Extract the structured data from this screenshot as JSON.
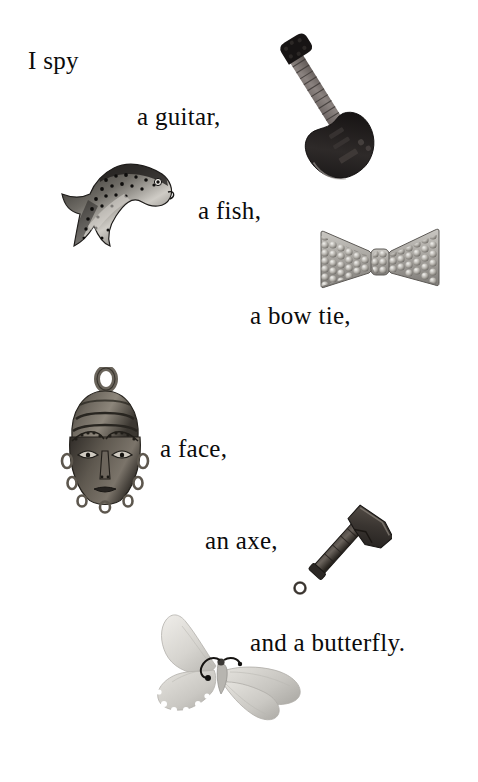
{
  "page": {
    "title": "I Spy",
    "background_color": "#ffffff",
    "text_color": "#0b0b0b",
    "width": 478,
    "height": 782
  },
  "riddle": {
    "lines": [
      {
        "id": "line-1",
        "text": "I spy",
        "x": 28,
        "y": 48,
        "font_size": 25
      },
      {
        "id": "line-2",
        "text": "a guitar,",
        "x": 137,
        "y": 104,
        "font_size": 25
      },
      {
        "id": "line-3",
        "text": "a fish,",
        "x": 198,
        "y": 198,
        "font_size": 25
      },
      {
        "id": "line-4",
        "text": "a bow tie,",
        "x": 250,
        "y": 303,
        "font_size": 25
      },
      {
        "id": "line-5",
        "text": "a face,",
        "x": 160,
        "y": 436,
        "font_size": 25
      },
      {
        "id": "line-6",
        "text": "an axe,",
        "x": 205,
        "y": 528,
        "font_size": 25
      },
      {
        "id": "line-7",
        "text": "and a butterfly.",
        "x": 250,
        "y": 630,
        "font_size": 25
      }
    ]
  },
  "objects": [
    {
      "id": "guitar",
      "label": "electric guitar",
      "x": 268,
      "y": 28,
      "width": 122,
      "height": 160,
      "color": "#241f1f"
    },
    {
      "id": "fish",
      "label": "speckled trout fish",
      "x": 58,
      "y": 156,
      "width": 126,
      "height": 112,
      "color": "#4a4744"
    },
    {
      "id": "bow-tie",
      "label": "rhinestone bow tie",
      "x": 313,
      "y": 227,
      "width": 134,
      "height": 72,
      "color": "#9a9893"
    },
    {
      "id": "mask",
      "label": "bronze face mask",
      "x": 50,
      "y": 367,
      "width": 110,
      "height": 150,
      "color": "#504b46"
    },
    {
      "id": "axe",
      "label": "metal axe charm",
      "x": 286,
      "y": 498,
      "width": 106,
      "height": 100,
      "color": "#3a3634"
    },
    {
      "id": "butterfly",
      "label": "pale gray butterfly",
      "x": 152,
      "y": 608,
      "width": 156,
      "height": 120,
      "color": "#d2d2cf"
    }
  ]
}
